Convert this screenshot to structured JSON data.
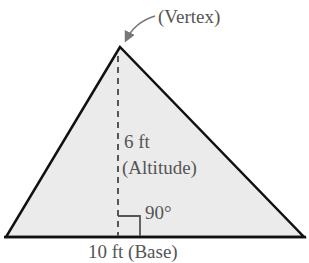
{
  "diagram": {
    "type": "triangle-area",
    "vertex_label": "(Vertex)",
    "altitude_value": "6 ft",
    "altitude_label": "(Altitude)",
    "angle_label": "90°",
    "base_label": "10 ft (Base)",
    "colors": {
      "fill": "#ebebeb",
      "stroke": "#111111",
      "text": "#555555",
      "arrow": "#777777"
    }
  }
}
